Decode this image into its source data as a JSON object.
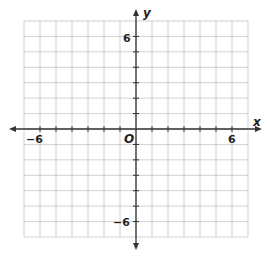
{
  "chart_data": {
    "type": "scatter",
    "title": "",
    "xlabel": "x",
    "ylabel": "y",
    "origin_label": "O",
    "xlim": [
      -7,
      7
    ],
    "ylim": [
      -7,
      7
    ],
    "grid": true,
    "grid_step": 1,
    "tick_labels": {
      "x": [
        {
          "value": -6,
          "label": "−6"
        },
        {
          "value": 6,
          "label": "6"
        }
      ],
      "y": [
        {
          "value": 6,
          "label": "6"
        },
        {
          "value": -6,
          "label": "−6"
        }
      ]
    },
    "series": [],
    "colors": {
      "grid": "#d0d0d0",
      "axis": "#333333",
      "text": "#222222"
    }
  }
}
